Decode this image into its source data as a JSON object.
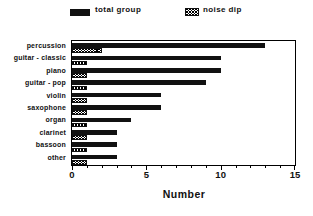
{
  "colors": {
    "bar_fill": "#111111",
    "axis": "#000000",
    "background": "#ffffff",
    "text": "#111111"
  },
  "legend": {
    "items": [
      {
        "label": "total group",
        "style": "solid"
      },
      {
        "label": "noise dip",
        "style": "hatched"
      }
    ]
  },
  "chart_data": {
    "type": "bar",
    "orientation": "horizontal",
    "title": "",
    "categories": [
      "percussion",
      "guitar - classic",
      "piano",
      "guitar - pop",
      "violin",
      "saxophone",
      "organ",
      "clarinet",
      "bassoon",
      "other"
    ],
    "series": [
      {
        "name": "total group",
        "style": "solid",
        "values": [
          13,
          10,
          10,
          9,
          6,
          6,
          4,
          3,
          3,
          3
        ]
      },
      {
        "name": "noise dip",
        "style": "hatched",
        "values": [
          2,
          1,
          1,
          1,
          1,
          1,
          1,
          1,
          1,
          1
        ]
      }
    ],
    "xlabel": "Number",
    "xlim": [
      0,
      15
    ],
    "xticks": [
      0,
      5,
      10,
      15
    ],
    "minor_tick_step": 1,
    "grid": false,
    "legend_position": "top"
  }
}
